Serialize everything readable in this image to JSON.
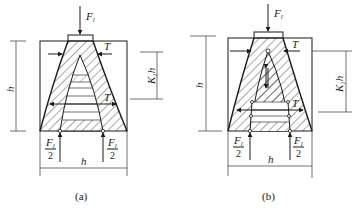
{
  "figure": {
    "panels": [
      {
        "id": "a",
        "caption": "(a)",
        "load_label": "F",
        "load_sub": "l",
        "tension_label_top": "T",
        "tension_label_mid": "T",
        "reaction_left": {
          "num": "F",
          "sub": "l",
          "den": "2"
        },
        "reaction_right": {
          "num": "F",
          "sub": "l",
          "den": "2"
        },
        "dim_height": "h",
        "dim_k1h": "K",
        "dim_k1h_sub": "1",
        "dim_k1h_h": "h",
        "dim_width": "h"
      },
      {
        "id": "b",
        "caption": "(b)",
        "load_label": "F",
        "load_sub": "l",
        "tension_label_top": "T",
        "tension_label_mid": "T",
        "reaction_left": {
          "num": "F",
          "sub": "l",
          "den": "2"
        },
        "reaction_right": {
          "num": "F",
          "sub": "l",
          "den": "2"
        },
        "dim_height": "h",
        "dim_k1h": "K",
        "dim_k1h_sub": "1",
        "dim_k1h_h": "h",
        "dim_width": "h"
      }
    ]
  }
}
